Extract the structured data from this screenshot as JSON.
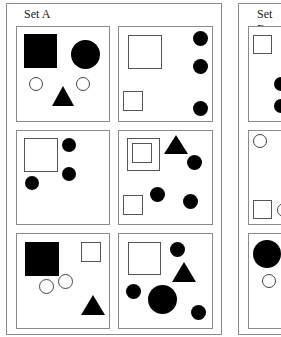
{
  "sets": [
    {
      "title": "Set A"
    },
    {
      "title": "Set B"
    }
  ],
  "set_a_cells": [
    {
      "id": "A1",
      "shapes": [
        "filled-square-large",
        "filled-circle-large",
        "outline-circle-small",
        "outline-circle-small",
        "filled-triangle"
      ]
    },
    {
      "id": "A2",
      "shapes": [
        "outline-square-large",
        "outline-square-small",
        "filled-circle",
        "filled-circle",
        "filled-circle"
      ]
    },
    {
      "id": "A3",
      "shapes": [
        "outline-square-large",
        "filled-circle",
        "filled-circle",
        "filled-circle"
      ]
    },
    {
      "id": "A4",
      "shapes": [
        "nested-outline-squares",
        "outline-square-small",
        "filled-triangle",
        "filled-circle",
        "filled-circle",
        "filled-circle"
      ]
    },
    {
      "id": "A5",
      "shapes": [
        "filled-square-large",
        "outline-square-small",
        "outline-circle-small",
        "outline-circle-small",
        "filled-triangle"
      ]
    },
    {
      "id": "A6",
      "shapes": [
        "outline-square-large",
        "filled-circle",
        "filled-triangle",
        "filled-circle",
        "filled-circle-large",
        "filled-circle"
      ]
    }
  ],
  "set_b_cells_visible": [
    {
      "id": "B1",
      "shapes": [
        "outline-square-small",
        "filled-circle",
        "filled-circle"
      ]
    },
    {
      "id": "B3",
      "shapes": [
        "outline-circle-small",
        "outline-square-small"
      ]
    },
    {
      "id": "B5",
      "shapes": [
        "filled-circle-large",
        "outline-circle-small"
      ]
    }
  ]
}
